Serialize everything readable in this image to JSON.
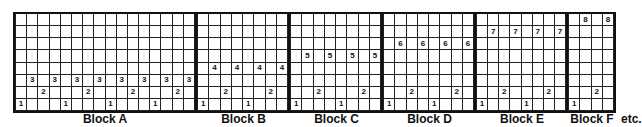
{
  "diagram": {
    "rows": 8,
    "blocks": [
      {
        "label": "Block A",
        "cols": 16,
        "width": 184,
        "marks": [
          {
            "row": 1,
            "col": 1,
            "v": "1"
          },
          {
            "row": 1,
            "col": 5,
            "v": "1"
          },
          {
            "row": 1,
            "col": 9,
            "v": "1"
          },
          {
            "row": 1,
            "col": 13,
            "v": "1"
          },
          {
            "row": 2,
            "col": 3,
            "v": "2"
          },
          {
            "row": 2,
            "col": 7,
            "v": "2"
          },
          {
            "row": 2,
            "col": 11,
            "v": "2"
          },
          {
            "row": 2,
            "col": 15,
            "v": "2"
          },
          {
            "row": 3,
            "col": 2,
            "v": "3"
          },
          {
            "row": 3,
            "col": 4,
            "v": "3"
          },
          {
            "row": 3,
            "col": 6,
            "v": "3"
          },
          {
            "row": 3,
            "col": 8,
            "v": "3"
          },
          {
            "row": 3,
            "col": 10,
            "v": "3"
          },
          {
            "row": 3,
            "col": 12,
            "v": "3"
          },
          {
            "row": 3,
            "col": 14,
            "v": "3"
          },
          {
            "row": 3,
            "col": 16,
            "v": "3"
          }
        ]
      },
      {
        "label": "Block B",
        "cols": 8,
        "width": 93,
        "marks": [
          {
            "row": 1,
            "col": 1,
            "v": "1"
          },
          {
            "row": 1,
            "col": 5,
            "v": "1"
          },
          {
            "row": 2,
            "col": 3,
            "v": "2"
          },
          {
            "row": 2,
            "col": 7,
            "v": "2"
          },
          {
            "row": 4,
            "col": 2,
            "v": "4"
          },
          {
            "row": 4,
            "col": 4,
            "v": "4"
          },
          {
            "row": 4,
            "col": 6,
            "v": "4"
          },
          {
            "row": 4,
            "col": 8,
            "v": "4"
          }
        ]
      },
      {
        "label": "Block C",
        "cols": 8,
        "width": 93,
        "marks": [
          {
            "row": 1,
            "col": 1,
            "v": "1"
          },
          {
            "row": 1,
            "col": 5,
            "v": "1"
          },
          {
            "row": 2,
            "col": 3,
            "v": "2"
          },
          {
            "row": 2,
            "col": 7,
            "v": "2"
          },
          {
            "row": 5,
            "col": 2,
            "v": "5"
          },
          {
            "row": 5,
            "col": 4,
            "v": "5"
          },
          {
            "row": 5,
            "col": 6,
            "v": "5"
          },
          {
            "row": 5,
            "col": 8,
            "v": "5"
          }
        ]
      },
      {
        "label": "Block D",
        "cols": 8,
        "width": 93,
        "marks": [
          {
            "row": 1,
            "col": 1,
            "v": "1"
          },
          {
            "row": 1,
            "col": 5,
            "v": "1"
          },
          {
            "row": 2,
            "col": 3,
            "v": "2"
          },
          {
            "row": 2,
            "col": 7,
            "v": "2"
          },
          {
            "row": 6,
            "col": 2,
            "v": "6"
          },
          {
            "row": 6,
            "col": 4,
            "v": "6"
          },
          {
            "row": 6,
            "col": 6,
            "v": "6"
          },
          {
            "row": 6,
            "col": 8,
            "v": "6"
          }
        ]
      },
      {
        "label": "Block E",
        "cols": 8,
        "width": 92,
        "marks": [
          {
            "row": 1,
            "col": 1,
            "v": "1"
          },
          {
            "row": 1,
            "col": 5,
            "v": "1"
          },
          {
            "row": 2,
            "col": 3,
            "v": "2"
          },
          {
            "row": 2,
            "col": 7,
            "v": "2"
          },
          {
            "row": 7,
            "col": 2,
            "v": "7"
          },
          {
            "row": 7,
            "col": 4,
            "v": "7"
          },
          {
            "row": 7,
            "col": 6,
            "v": "7"
          },
          {
            "row": 7,
            "col": 8,
            "v": "7"
          }
        ]
      },
      {
        "label": "Block F",
        "cols": 4,
        "width": 48,
        "marks": [
          {
            "row": 1,
            "col": 1,
            "v": "1"
          },
          {
            "row": 2,
            "col": 3,
            "v": "2"
          },
          {
            "row": 8,
            "col": 2,
            "v": "8"
          },
          {
            "row": 8,
            "col": 4,
            "v": "8"
          }
        ]
      }
    ],
    "trailing_text": "etc."
  }
}
